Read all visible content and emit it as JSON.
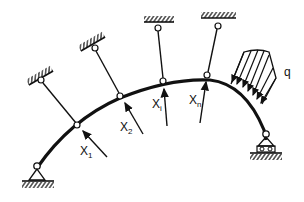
{
  "diagram": {
    "type": "structural-arch",
    "colors": {
      "stroke": "#111111",
      "background": "#ffffff"
    },
    "labels": {
      "x1": {
        "main": "X",
        "sub": "1"
      },
      "x2": {
        "main": "X",
        "sub": "2"
      },
      "xi": {
        "main": "X",
        "sub": "i"
      },
      "xn": {
        "main": "X",
        "sub": "n"
      },
      "load": "q"
    },
    "supports": {
      "left": "pinned-support",
      "right": "roller-support"
    }
  }
}
